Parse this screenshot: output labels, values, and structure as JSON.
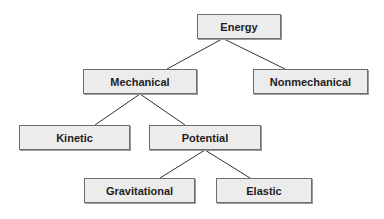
{
  "diagram": {
    "type": "tree",
    "colors": {
      "box_fill": "#ececec",
      "box_border": "#6e6e6e",
      "line": "#333333",
      "text": "#1e1e1e"
    },
    "nodes": {
      "energy": {
        "label": "Energy",
        "x": 197,
        "y": 14,
        "w": 84,
        "h": 25
      },
      "mechanical": {
        "label": "Mechanical",
        "x": 83,
        "y": 69,
        "w": 114,
        "h": 25
      },
      "nonmechanical": {
        "label": "Nonmechanical",
        "x": 253,
        "y": 69,
        "w": 115,
        "h": 25
      },
      "kinetic": {
        "label": "Kinetic",
        "x": 19,
        "y": 125,
        "w": 111,
        "h": 25
      },
      "potential": {
        "label": "Potential",
        "x": 149,
        "y": 125,
        "w": 112,
        "h": 25
      },
      "gravitational": {
        "label": "Gravitational",
        "x": 84,
        "y": 178,
        "w": 111,
        "h": 25
      },
      "elastic": {
        "label": "Elastic",
        "x": 216,
        "y": 178,
        "w": 96,
        "h": 25
      }
    },
    "edges": [
      [
        "energy",
        "mechanical"
      ],
      [
        "energy",
        "nonmechanical"
      ],
      [
        "mechanical",
        "kinetic"
      ],
      [
        "mechanical",
        "potential"
      ],
      [
        "potential",
        "gravitational"
      ],
      [
        "potential",
        "elastic"
      ]
    ]
  }
}
